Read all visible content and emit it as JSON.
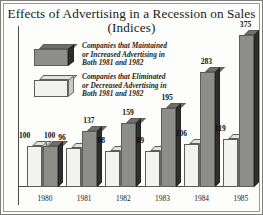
{
  "chart_data": {
    "type": "bar",
    "title": "Effects of Advertising in a Recession on Sales",
    "subtitle": "(Indices)",
    "xlabel": "",
    "ylabel": "",
    "grid": false,
    "legend_position": "top-left",
    "ylim": [
      0,
      375
    ],
    "categories": [
      "1980",
      "1981",
      "1982",
      "1983",
      "1984",
      "1985"
    ],
    "series": [
      {
        "name": "Companies that Eliminated or Decreased Advertising in Both 1981 and 1982",
        "color": "#f2f2ee",
        "values": [
          100,
          96,
          88,
          89,
          106,
          119
        ]
      },
      {
        "name": "Companies that Maintained or Increased Advertising in Both 1981 and 1982",
        "color": "#8d8d8a",
        "values": [
          100,
          137,
          159,
          195,
          283,
          375
        ]
      }
    ]
  },
  "title": {
    "line1": "Effects of Advertising in a Recession on Sales",
    "line2": "(Indices)"
  },
  "legend": {
    "items": [
      {
        "swatch": "dark-cube-swatch",
        "line1": "Companies that Maintained",
        "line2": "or Increased Advertising in",
        "line3": "Both 1981 and 1982"
      },
      {
        "swatch": "light-cube-swatch",
        "line1": "Companies that Eliminated",
        "line2": "or Decreased Advertising in",
        "line3": "Both 1981 and 1982"
      }
    ]
  },
  "groups": [
    {
      "year": "1980",
      "light_value": "100",
      "dark_value": "100"
    },
    {
      "year": "1981",
      "light_value": "96",
      "dark_value": "137"
    },
    {
      "year": "1982",
      "light_value": "88",
      "dark_value": "159"
    },
    {
      "year": "1983",
      "light_value": "89",
      "dark_value": "195"
    },
    {
      "year": "1984",
      "light_value": "106",
      "dark_value": "283"
    },
    {
      "year": "1985",
      "light_value": "119",
      "dark_value": "375"
    }
  ]
}
